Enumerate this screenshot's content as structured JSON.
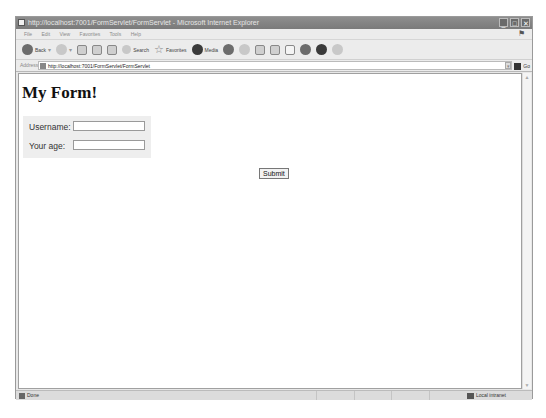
{
  "window": {
    "title": "http://localhost:7001/FormServlet/FormServlet - Microsoft Internet Explorer",
    "controls": {
      "minimize": "_",
      "maximize": "□",
      "close": "✕"
    }
  },
  "menubar": {
    "items": [
      "File",
      "Edit",
      "View",
      "Favorites",
      "Tools",
      "Help"
    ]
  },
  "toolbar": {
    "back_label": "Back",
    "search_label": "Search",
    "favorites_label": "Favorites",
    "media_label": "Media"
  },
  "addressbar": {
    "label": "Address",
    "url": "http://localhost:7001/FormServlet/FormServlet",
    "go_label": "Go"
  },
  "page": {
    "heading": "My Form!",
    "fields": [
      {
        "label": "Username:",
        "value": ""
      },
      {
        "label": "Your age:",
        "value": ""
      }
    ],
    "submit_label": "Submit"
  },
  "statusbar": {
    "status": "Done",
    "zone": "Local intranet"
  }
}
